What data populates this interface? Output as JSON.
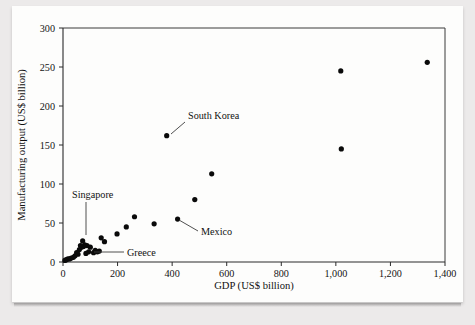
{
  "figure": {
    "background_color": "#eceaea",
    "sheet_color": "#fdfdfc",
    "marker_color": "#0a0a0a"
  },
  "chart_data": {
    "type": "scatter",
    "title": "",
    "xlabel": "GDP (US$ billion)",
    "ylabel": "Manufacturing output (US$ billion)",
    "xlim": [
      0,
      1400
    ],
    "ylim": [
      0,
      300
    ],
    "xticks": [
      0,
      200,
      400,
      600,
      800,
      1000,
      1200,
      1400
    ],
    "xticklabels": [
      "0",
      "200",
      "400",
      "600",
      "800",
      "1,000",
      "1,200",
      "1,400"
    ],
    "yticks": [
      0,
      50,
      100,
      150,
      200,
      250,
      300
    ],
    "yticklabels": [
      "0",
      "50",
      "100",
      "150",
      "200",
      "250",
      "300"
    ],
    "grid": false,
    "legend": "none",
    "points": [
      {
        "x": 1335,
        "y": 256,
        "label": ""
      },
      {
        "x": 1018,
        "y": 245,
        "label": ""
      },
      {
        "x": 1020,
        "y": 145,
        "label": ""
      },
      {
        "x": 545,
        "y": 113,
        "label": ""
      },
      {
        "x": 483,
        "y": 80,
        "label": ""
      },
      {
        "x": 420,
        "y": 55,
        "label": "Mexico"
      },
      {
        "x": 380,
        "y": 162,
        "label": "South Korea"
      },
      {
        "x": 334,
        "y": 49,
        "label": ""
      },
      {
        "x": 262,
        "y": 58,
        "label": ""
      },
      {
        "x": 232,
        "y": 45,
        "label": ""
      },
      {
        "x": 198,
        "y": 36,
        "label": ""
      },
      {
        "x": 152,
        "y": 26,
        "label": ""
      },
      {
        "x": 140,
        "y": 31,
        "label": ""
      },
      {
        "x": 133,
        "y": 14,
        "label": ""
      },
      {
        "x": 126,
        "y": 13,
        "label": ""
      },
      {
        "x": 118,
        "y": 15,
        "label": ""
      },
      {
        "x": 112,
        "y": 12,
        "label": "Greece"
      },
      {
        "x": 100,
        "y": 19,
        "label": ""
      },
      {
        "x": 94,
        "y": 13,
        "label": ""
      },
      {
        "x": 88,
        "y": 21,
        "label": ""
      },
      {
        "x": 84,
        "y": 11,
        "label": ""
      },
      {
        "x": 80,
        "y": 22,
        "label": ""
      },
      {
        "x": 75,
        "y": 20,
        "label": ""
      },
      {
        "x": 72,
        "y": 27,
        "label": "Singapore"
      },
      {
        "x": 68,
        "y": 19,
        "label": ""
      },
      {
        "x": 64,
        "y": 21,
        "label": ""
      },
      {
        "x": 60,
        "y": 16,
        "label": ""
      },
      {
        "x": 55,
        "y": 10,
        "label": ""
      },
      {
        "x": 50,
        "y": 12,
        "label": ""
      },
      {
        "x": 44,
        "y": 8,
        "label": ""
      },
      {
        "x": 38,
        "y": 6,
        "label": ""
      },
      {
        "x": 30,
        "y": 5,
        "label": ""
      },
      {
        "x": 24,
        "y": 4,
        "label": ""
      },
      {
        "x": 18,
        "y": 4,
        "label": ""
      },
      {
        "x": 12,
        "y": 3,
        "label": ""
      },
      {
        "x": 7,
        "y": 2,
        "label": ""
      }
    ],
    "annotations": [
      {
        "name": "south-korea",
        "text": "South Korea",
        "text_x": 188,
        "text_y": 119,
        "anchor": "start",
        "leader": [
          [
            185,
            122
          ],
          [
            171,
            134
          ]
        ]
      },
      {
        "name": "mexico",
        "text": "Mexico",
        "text_x": 201,
        "text_y": 235,
        "anchor": "start",
        "leader": [
          [
            198,
            231
          ],
          [
            179,
            220
          ]
        ]
      },
      {
        "name": "singapore",
        "text": "Singapore",
        "text_x": 72,
        "text_y": 198,
        "anchor": "start",
        "leader": [
          [
            86,
            202
          ],
          [
            86,
            235
          ]
        ]
      },
      {
        "name": "greece",
        "text": "Greece",
        "text_x": 127,
        "text_y": 256,
        "anchor": "start",
        "leader": [
          [
            124,
            252
          ],
          [
            94,
            252
          ]
        ]
      }
    ]
  }
}
